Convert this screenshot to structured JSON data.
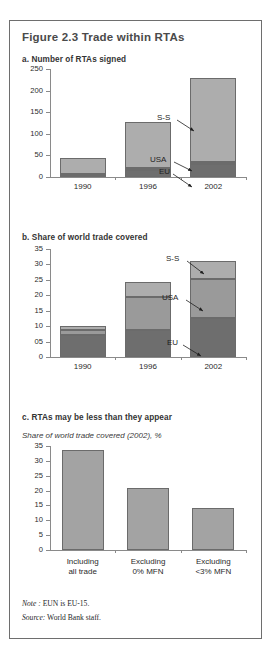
{
  "figure": {
    "title": "Figure 2.3  Trade within RTAs",
    "note_label": "Note :",
    "note_text": " EUN is EU-15.",
    "source_label": "Source:",
    "source_text": " World Bank staff."
  },
  "panel_a": {
    "title": "a. Number of RTAs signed",
    "annotations": {
      "ss": "S-S",
      "usa": "USA",
      "eu": "EU"
    }
  },
  "panel_b": {
    "title": "b. Share of world trade covered",
    "annotations": {
      "ss": "S-S",
      "usa": "USA",
      "eu": "EU"
    }
  },
  "panel_c": {
    "title": "c. RTAs may be less than they appear",
    "subtitle": "Share of world trade covered (2002), %"
  },
  "colors": {
    "segment_eu": "#6e6e6e",
    "segment_usa": "#9a9a9a",
    "segment_ss": "#adadad",
    "bar_plain": "#a3a3a3",
    "axis": "#8a8a8a",
    "frame": "#6e6e6e",
    "title_text": "#4a4a4a"
  },
  "chart_data": [
    {
      "id": "a",
      "type": "bar",
      "stacked": true,
      "title": "a. Number of RTAs signed",
      "xlabel": "",
      "ylabel": "",
      "ylim": [
        0,
        250
      ],
      "yticks": [
        0,
        50,
        100,
        150,
        200,
        250
      ],
      "ytick_labels": [
        "0",
        "50",
        "100",
        "150",
        "200",
        "250"
      ],
      "grid": false,
      "legend": "inline-annotations",
      "categories": [
        "1990",
        "1996",
        "2002"
      ],
      "series": [
        {
          "name": "EU",
          "values": [
            5,
            17,
            30
          ]
        },
        {
          "name": "USA",
          "values": [
            2,
            3,
            4
          ]
        },
        {
          "name": "S-S",
          "values": [
            36,
            108,
            195
          ]
        }
      ],
      "totals": [
        43,
        128,
        229
      ]
    },
    {
      "id": "b",
      "type": "bar",
      "stacked": true,
      "title": "b. Share of world trade covered",
      "xlabel": "",
      "ylabel": "",
      "ylim": [
        0,
        35
      ],
      "yticks": [
        0,
        5,
        10,
        15,
        20,
        25,
        30,
        35
      ],
      "ytick_labels": [
        "0",
        "05",
        "10",
        "15",
        "20",
        "25",
        "30",
        "35"
      ],
      "grid": false,
      "legend": "inline-annotations",
      "categories": [
        "1990",
        "1996",
        "2002"
      ],
      "series": [
        {
          "name": "EU",
          "values": [
            7.1,
            8.9,
            12.7
          ]
        },
        {
          "name": "USA",
          "values": [
            1.6,
            10.4,
            12.6
          ]
        },
        {
          "name": "S-S",
          "values": [
            1.4,
            5.1,
            5.9
          ]
        }
      ],
      "totals": [
        10.1,
        24.4,
        31.2
      ]
    },
    {
      "id": "c",
      "type": "bar",
      "stacked": false,
      "title": "c. RTAs may be less than they appear",
      "subtitle": "Share of world trade covered (2002), %",
      "xlabel": "",
      "ylabel": "",
      "ylim": [
        0,
        35
      ],
      "yticks": [
        0,
        5,
        10,
        15,
        20,
        25,
        30,
        35
      ],
      "ytick_labels": [
        "0",
        "5",
        "10",
        "15",
        "20",
        "25",
        "30",
        "35"
      ],
      "grid": false,
      "categories": [
        "Including\nall trade",
        "Excluding\n0% MFN",
        "Excluding\n<3% MFN"
      ],
      "category_lines": [
        [
          "Including",
          "all trade"
        ],
        [
          "Excluding",
          "0% MFN"
        ],
        [
          "Excluding",
          "<3% MFN"
        ]
      ],
      "values": [
        33.5,
        20.8,
        14.3
      ]
    }
  ]
}
